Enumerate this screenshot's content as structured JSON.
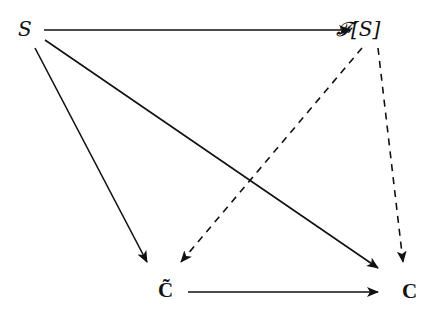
{
  "diagram": {
    "type": "commutative-diagram",
    "nodes": [
      {
        "id": "S",
        "label": "S",
        "x": 30,
        "y": 30
      },
      {
        "id": "FS",
        "label": "𝓕[S]",
        "x": 375,
        "y": 30
      },
      {
        "id": "Ctilde",
        "label": "C̃",
        "x": 167,
        "y": 292
      },
      {
        "id": "C",
        "label": "C",
        "x": 410,
        "y": 292
      }
    ],
    "edges": [
      {
        "from": "S",
        "to": "FS",
        "style": "solid"
      },
      {
        "from": "S",
        "to": "Ctilde",
        "style": "solid"
      },
      {
        "from": "S",
        "to": "C",
        "style": "solid"
      },
      {
        "from": "FS",
        "to": "Ctilde",
        "style": "dashed"
      },
      {
        "from": "FS",
        "to": "C",
        "style": "dashed"
      },
      {
        "from": "Ctilde",
        "to": "C",
        "style": "solid"
      }
    ]
  },
  "labels": {
    "s": "S",
    "fs_f": "𝓕",
    "fs_rest": "[S]",
    "ctilde": "C̃",
    "c": "C"
  }
}
